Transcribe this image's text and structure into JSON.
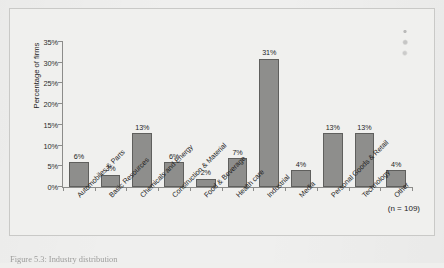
{
  "chart_data": {
    "type": "bar",
    "title": "",
    "xlabel": "",
    "ylabel": "Percentage of firms",
    "ylim": [
      0,
      35
    ],
    "ytick_labels": [
      "35%",
      "30%",
      "25%",
      "20%",
      "15%",
      "10%",
      "5%",
      "0%"
    ],
    "ytick_values": [
      35,
      30,
      25,
      20,
      15,
      10,
      5,
      0
    ],
    "grid": false,
    "legend": "none",
    "categories": [
      "Automobiles & Parts",
      "Basic Resources",
      "Chemicals and Energy",
      "Construction & Material",
      "Food & Beverage",
      "Health care",
      "Industrial",
      "Media",
      "Personal Goods & Retail",
      "Technology",
      "Other"
    ],
    "values": [
      6,
      3,
      13,
      6,
      2,
      7,
      31,
      4,
      13,
      13,
      4
    ],
    "value_labels": [
      "6%",
      "3%",
      "13%",
      "6%",
      "2%",
      "7%",
      "31%",
      "4%",
      "13%",
      "13%",
      "4%"
    ],
    "annotations": [
      "(n = 109)"
    ],
    "bar_color": "#8e8e8c",
    "bar_border_color": "#5f5f5d",
    "axis_color": "#8c8c8a",
    "background_color": "#f0f0ee"
  },
  "annotation": {
    "sample_size": "(n = 109)"
  },
  "caption": {
    "text": "Figure 5.3: Industry distribution"
  }
}
